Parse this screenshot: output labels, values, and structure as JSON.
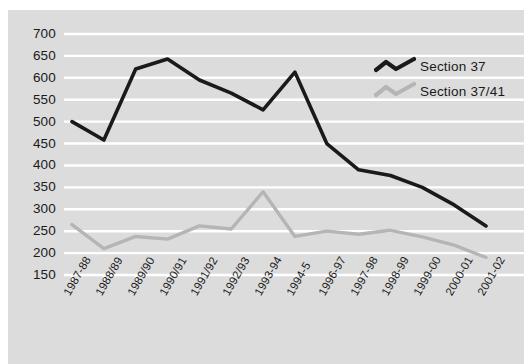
{
  "chart_data": {
    "type": "line",
    "title": "",
    "xlabel": "",
    "ylabel": "",
    "ylim": [
      150,
      700
    ],
    "ytick_step": 50,
    "grid": true,
    "grid_orientation": "horizontal",
    "legend_position": "top-right",
    "plot_background": "#dcdcdc",
    "gridline_color": "#ffffff",
    "categories": [
      "1987-88",
      "1988/89",
      "1989/90",
      "1990/91",
      "1991/92",
      "1992/93",
      "1993-94",
      "1994-5",
      "1996-97",
      "1997-98",
      "1998-99",
      "1999-00",
      "2000-01",
      "2001-02"
    ],
    "ytick_labels": [
      "700",
      "650",
      "600",
      "550",
      "500",
      "450",
      "400",
      "350",
      "300",
      "250",
      "200",
      "150"
    ],
    "ytick_values": [
      700,
      650,
      600,
      550,
      500,
      450,
      400,
      350,
      300,
      250,
      200,
      150
    ],
    "series": [
      {
        "name": "Section 37",
        "color": "#1a1a1a",
        "values": [
          500,
          458,
          620,
          643,
          595,
          565,
          527,
          613,
          450,
          390,
          377,
          350,
          310,
          262
        ]
      },
      {
        "name": "Section 37/41",
        "color": "#b5b5b5",
        "values": [
          265,
          210,
          238,
          232,
          262,
          255,
          340,
          238,
          250,
          243,
          252,
          237,
          218,
          190
        ]
      }
    ]
  },
  "legend": {
    "items": [
      {
        "label": "Section 37",
        "color": "#1a1a1a"
      },
      {
        "label": "Section 37/41",
        "color": "#b5b5b5"
      }
    ]
  }
}
